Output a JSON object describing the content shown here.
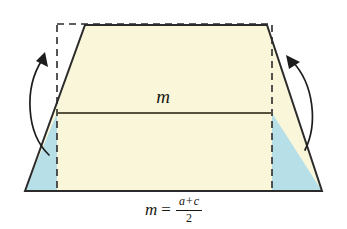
{
  "figure": {
    "midsegment_label": "m",
    "formula": {
      "lhs": "m",
      "equals": "=",
      "numerator_left": "a",
      "numerator_operator": "+",
      "numerator_right": "c",
      "denominator": "2"
    },
    "colors": {
      "trapezoid_fill": "#faf6da",
      "triangle_fill": "#b6dfe8",
      "outline": "#2b2b2b",
      "dashed": "#2b2b2b",
      "background": "#ffffff",
      "text": "#17170f"
    },
    "geometry": {
      "trapezoid": [
        [
          25,
          191
        ],
        [
          85,
          25
        ],
        [
          267,
          25
        ],
        [
          322,
          191
        ]
      ],
      "dashed_rect": {
        "x": 57,
        "y": 24,
        "width": 215,
        "height": 167
      },
      "midsegment": {
        "x1": 57,
        "y1": 113,
        "x2": 272,
        "y2": 113
      },
      "left_triangle": [
        [
          25,
          191
        ],
        [
          57,
          113
        ],
        [
          57,
          191
        ]
      ],
      "right_triangle": [
        [
          322,
          191
        ],
        [
          272,
          113
        ],
        [
          272,
          191
        ]
      ]
    },
    "annotations": {
      "left_arrow": "curved-rotation-arrow-left",
      "right_arrow": "curved-rotation-arrow-right"
    }
  }
}
